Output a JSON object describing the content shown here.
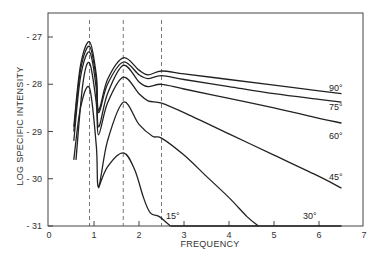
{
  "chart_data": {
    "type": "line",
    "title": "",
    "xlabel": "FREQUENCY",
    "ylabel": "LOG SPECIFIC INTENSITY",
    "xlim": [
      0,
      7
    ],
    "ylim": [
      -31,
      -26.5
    ],
    "x_ticks": [
      "0",
      "1",
      "2",
      "3",
      "4",
      "5",
      "6",
      "7"
    ],
    "y_ticks": [
      "-27",
      "-28",
      "-29",
      "-30",
      "-31"
    ],
    "grid": false,
    "legend": "inline labels at right end of curves",
    "reference_lines_x": [
      0.9,
      1.65,
      2.5
    ],
    "series": [
      {
        "name": "90°",
        "x": [
          0.55,
          0.7,
          0.9,
          1.05,
          1.1,
          1.3,
          1.65,
          2.0,
          2.2,
          2.5,
          3.0,
          4.0,
          5.0,
          6.0,
          6.5
        ],
        "values": [
          -28.9,
          -27.6,
          -27.1,
          -27.8,
          -28.55,
          -27.9,
          -27.44,
          -27.7,
          -27.8,
          -27.72,
          -27.78,
          -27.9,
          -28.02,
          -28.14,
          -28.2
        ]
      },
      {
        "name": "75°",
        "x": [
          0.55,
          0.7,
          0.9,
          1.05,
          1.1,
          1.3,
          1.65,
          2.0,
          2.2,
          2.5,
          3.0,
          4.0,
          5.0,
          6.0,
          6.5
        ],
        "values": [
          -29.0,
          -27.7,
          -27.2,
          -27.9,
          -28.6,
          -28.0,
          -27.53,
          -27.8,
          -27.88,
          -27.82,
          -27.9,
          -28.05,
          -28.2,
          -28.32,
          -28.38
        ]
      },
      {
        "name": "60°",
        "x": [
          0.55,
          0.7,
          0.9,
          1.05,
          1.1,
          1.3,
          1.65,
          2.0,
          2.2,
          2.5,
          3.0,
          4.0,
          5.0,
          6.0,
          6.5
        ],
        "values": [
          -29.2,
          -27.85,
          -27.32,
          -28.1,
          -28.9,
          -28.2,
          -27.6,
          -27.95,
          -28.05,
          -28.0,
          -28.1,
          -28.3,
          -28.5,
          -28.72,
          -28.82
        ]
      },
      {
        "name": "45°",
        "x": [
          0.6,
          0.75,
          0.9,
          1.05,
          1.1,
          1.3,
          1.65,
          2.0,
          2.2,
          2.5,
          3.0,
          4.0,
          5.0,
          6.0,
          6.5
        ],
        "values": [
          -29.6,
          -28.0,
          -27.55,
          -28.4,
          -29.07,
          -28.4,
          -27.85,
          -28.2,
          -28.35,
          -28.4,
          -28.6,
          -29.05,
          -29.5,
          -29.95,
          -30.2
        ]
      },
      {
        "name": "30°",
        "x": [
          0.55,
          0.7,
          0.9,
          1.05,
          1.1,
          1.3,
          1.65,
          2.0,
          2.3,
          2.5,
          3.0,
          3.5,
          4.0,
          4.4,
          4.65
        ],
        "values": [
          -29.6,
          -28.5,
          -28.08,
          -29.3,
          -30.17,
          -29.2,
          -28.38,
          -28.85,
          -29.1,
          -29.14,
          -29.5,
          -29.95,
          -30.4,
          -30.8,
          -31.0
        ]
      },
      {
        "name": "15°",
        "x": [
          1.1,
          1.3,
          1.65,
          1.9,
          2.1,
          2.25,
          2.45,
          2.6,
          2.7
        ],
        "values": [
          -30.2,
          -29.75,
          -29.45,
          -29.8,
          -30.4,
          -30.72,
          -30.8,
          -30.92,
          -31.0
        ]
      }
    ]
  },
  "labels": {
    "y_axis": "LOG SPECIFIC INTENSITY",
    "x_axis": "FREQUENCY",
    "x_ticks": [
      "0",
      "1",
      "2",
      "3",
      "4",
      "5",
      "6",
      "7"
    ],
    "y_ticks": [
      "-27",
      "-28",
      "-29",
      "-30",
      "-31"
    ],
    "series": [
      "90°",
      "75°",
      "60°",
      "45°",
      "30°",
      "15°"
    ]
  }
}
